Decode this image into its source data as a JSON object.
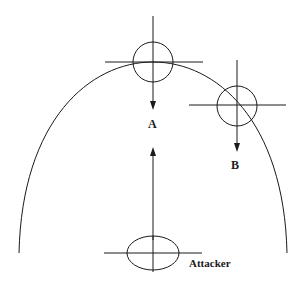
{
  "labels": {
    "point_a": "A",
    "point_b": "B",
    "attacker": "Attacker"
  },
  "colors": {
    "line": "#1a1a1a",
    "background": "#ffffff"
  },
  "elements": {
    "trajectory_arc": {
      "start": [
        19,
        252
      ],
      "apex": [
        153,
        62
      ],
      "end": [
        285,
        252
      ]
    },
    "target_a": {
      "shape": "circle",
      "center": [
        153,
        62
      ],
      "radius": 20,
      "arrow": "down"
    },
    "target_b": {
      "shape": "circle",
      "center": [
        237,
        106
      ],
      "radius": 20,
      "arrow": "down"
    },
    "attacker": {
      "shape": "ellipse",
      "center": [
        153,
        253
      ],
      "rx": 26,
      "ry": 17,
      "arrow": "up"
    }
  }
}
